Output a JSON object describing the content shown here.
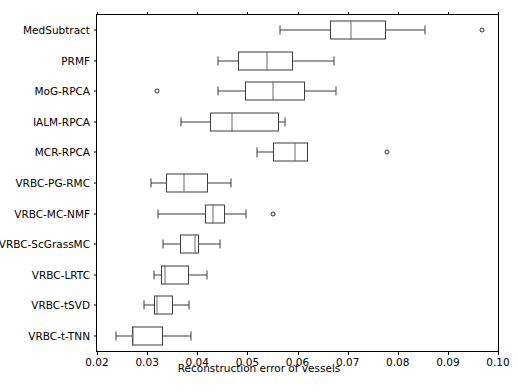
{
  "chart_data": {
    "type": "boxplot",
    "title": "",
    "xlabel": "Reconstruction error of vessels",
    "ylabel": "",
    "orientation": "horizontal",
    "grid": false,
    "legend": null,
    "xlim": [
      0.02,
      0.1
    ],
    "xticks": [
      0.02,
      0.03,
      0.04,
      0.05,
      0.06,
      0.07,
      0.08,
      0.09,
      0.1
    ],
    "xticklabels": [
      "0.02",
      "0.03",
      "0.04",
      "0.05",
      "0.06",
      "0.07",
      "0.08",
      "0.09",
      "0.10"
    ],
    "categories": [
      "MedSubtract",
      "PRMF",
      "MoG-RPCA",
      "IALM-RPCA",
      "MCR-RPCA",
      "VRBC-PG-RMC",
      "VRBC-MC-NMF",
      "VRBC-ScGrassMC",
      "VRBC-LRTC",
      "VRBC-tSVD",
      "VRBC-t-TNN"
    ],
    "boxes": [
      {
        "label": "MedSubtract",
        "whisker_low": 0.0565,
        "q1": 0.0665,
        "median": 0.0707,
        "q3": 0.0776,
        "whisker_high": 0.0854,
        "fliers": [
          0.0969
        ]
      },
      {
        "label": "PRMF",
        "whisker_low": 0.0441,
        "q1": 0.0481,
        "median": 0.0539,
        "q3": 0.0591,
        "whisker_high": 0.0673,
        "fliers": []
      },
      {
        "label": "MoG-RPCA",
        "whisker_low": 0.0441,
        "q1": 0.0496,
        "median": 0.0551,
        "q3": 0.0614,
        "whisker_high": 0.0676,
        "fliers": [
          0.0319
        ]
      },
      {
        "label": "IALM-RPCA",
        "whisker_low": 0.0368,
        "q1": 0.0426,
        "median": 0.047,
        "q3": 0.0564,
        "whisker_high": 0.0576,
        "fliers": []
      },
      {
        "label": "MCR-RPCA",
        "whisker_low": 0.052,
        "q1": 0.0551,
        "median": 0.0596,
        "q3": 0.0621,
        "whisker_high": 0.0621,
        "fliers": [
          0.0779
        ]
      },
      {
        "label": "VRBC-PG-RMC",
        "whisker_low": 0.0308,
        "q1": 0.0337,
        "median": 0.0374,
        "q3": 0.0421,
        "whisker_high": 0.0468,
        "fliers": []
      },
      {
        "label": "VRBC-MC-NMF",
        "whisker_low": 0.0321,
        "q1": 0.0415,
        "median": 0.0432,
        "q3": 0.0456,
        "whisker_high": 0.0498,
        "fliers": [
          0.0552
        ]
      },
      {
        "label": "VRBC-ScGrassMC",
        "whisker_low": 0.0332,
        "q1": 0.0366,
        "median": 0.0396,
        "q3": 0.0404,
        "whisker_high": 0.0445,
        "fliers": []
      },
      {
        "label": "VRBC-LRTC",
        "whisker_low": 0.0314,
        "q1": 0.0327,
        "median": 0.0335,
        "q3": 0.0383,
        "whisker_high": 0.042,
        "fliers": []
      },
      {
        "label": "VRBC-tSVD",
        "whisker_low": 0.0294,
        "q1": 0.0313,
        "median": 0.032,
        "q3": 0.0352,
        "whisker_high": 0.0384,
        "fliers": []
      },
      {
        "label": "VRBC-t-TNN",
        "whisker_low": 0.0238,
        "q1": 0.0269,
        "median": 0.0272,
        "q3": 0.0331,
        "whisker_high": 0.0388,
        "fliers": []
      }
    ],
    "colors": {
      "box_edge": "#3d3d3d",
      "median": "#6a6a6a",
      "whisker": "#3d3d3d",
      "flier_edge": "#2b2b2b",
      "axis": "#000000",
      "background": "#ffffff"
    }
  }
}
